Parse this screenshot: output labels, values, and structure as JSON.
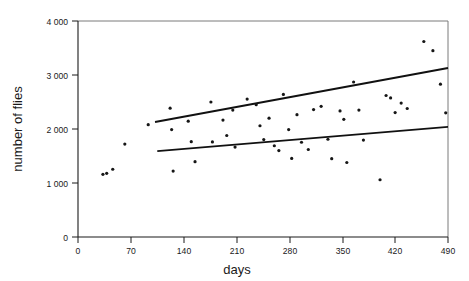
{
  "chart_data": {
    "type": "scatter",
    "title": "",
    "xlabel": "days",
    "ylabel": "number of flies",
    "xlim": [
      0,
      490
    ],
    "ylim": [
      0,
      4000
    ],
    "grid": false,
    "legend": "none",
    "x_ticks": [
      0,
      70,
      140,
      210,
      280,
      350,
      420,
      490
    ],
    "x_tick_labels": [
      "0",
      "70",
      "140",
      "210",
      "280",
      "350",
      "420",
      "490"
    ],
    "y_ticks": [
      0,
      1000,
      2000,
      3000,
      4000
    ],
    "y_tick_labels": [
      "0",
      "1 000",
      "2 000",
      "3 000",
      "4 000"
    ],
    "marker": "filled-circle",
    "marker_color": "#161616",
    "marker_size_px": 3.2,
    "points": [
      {
        "x": 33,
        "y": 1160
      },
      {
        "x": 38,
        "y": 1180
      },
      {
        "x": 46,
        "y": 1255
      },
      {
        "x": 62,
        "y": 1720
      },
      {
        "x": 93,
        "y": 2080
      },
      {
        "x": 122,
        "y": 2385
      },
      {
        "x": 124,
        "y": 1990
      },
      {
        "x": 126,
        "y": 1220
      },
      {
        "x": 146,
        "y": 2145
      },
      {
        "x": 150,
        "y": 1765
      },
      {
        "x": 155,
        "y": 1395
      },
      {
        "x": 176,
        "y": 2500
      },
      {
        "x": 178,
        "y": 1760
      },
      {
        "x": 192,
        "y": 2165
      },
      {
        "x": 197,
        "y": 1880
      },
      {
        "x": 205,
        "y": 2350
      },
      {
        "x": 208,
        "y": 1665
      },
      {
        "x": 224,
        "y": 2555
      },
      {
        "x": 236,
        "y": 2450
      },
      {
        "x": 241,
        "y": 2060
      },
      {
        "x": 246,
        "y": 1805
      },
      {
        "x": 253,
        "y": 2200
      },
      {
        "x": 260,
        "y": 1690
      },
      {
        "x": 266,
        "y": 1600
      },
      {
        "x": 272,
        "y": 2640
      },
      {
        "x": 279,
        "y": 1990
      },
      {
        "x": 283,
        "y": 1455
      },
      {
        "x": 290,
        "y": 2265
      },
      {
        "x": 296,
        "y": 1755
      },
      {
        "x": 305,
        "y": 1620
      },
      {
        "x": 312,
        "y": 2360
      },
      {
        "x": 322,
        "y": 2420
      },
      {
        "x": 331,
        "y": 1810
      },
      {
        "x": 336,
        "y": 1450
      },
      {
        "x": 347,
        "y": 2335
      },
      {
        "x": 352,
        "y": 2180
      },
      {
        "x": 356,
        "y": 1380
      },
      {
        "x": 365,
        "y": 2870
      },
      {
        "x": 372,
        "y": 2350
      },
      {
        "x": 378,
        "y": 1795
      },
      {
        "x": 400,
        "y": 1060
      },
      {
        "x": 408,
        "y": 2620
      },
      {
        "x": 414,
        "y": 2575
      },
      {
        "x": 420,
        "y": 2305
      },
      {
        "x": 428,
        "y": 2480
      },
      {
        "x": 436,
        "y": 2380
      },
      {
        "x": 458,
        "y": 3620
      },
      {
        "x": 470,
        "y": 3450
      },
      {
        "x": 480,
        "y": 2830
      },
      {
        "x": 487,
        "y": 2300
      }
    ],
    "fit_lines": [
      {
        "name": "upper-regression-line",
        "x_start": 102,
        "y_start": 2130,
        "x_end": 490,
        "y_end": 3130
      },
      {
        "name": "lower-regression-line",
        "x_start": 105,
        "y_start": 1590,
        "x_end": 490,
        "y_end": 2040
      }
    ]
  },
  "axes": {
    "x_title": "days",
    "y_title": "number of flies"
  }
}
